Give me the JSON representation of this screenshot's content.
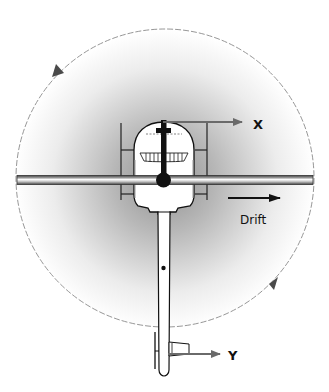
{
  "diagram": {
    "labels": {
      "x_axis": "X",
      "y_axis": "Y",
      "drift": "Drift"
    },
    "elements": {
      "rotor_disk": "dashed circle with two rotation-direction arrowheads (counter-clockwise indication)",
      "main_rotor_blade": "horizontal blade across the disk",
      "fuselage": "cockpit cabin viewed from above",
      "tail_boom": "long narrow tail boom with tail rotor",
      "rotor_hub": "black circle at center"
    },
    "colors": {
      "disk_gradient_center": "#9a9a9a",
      "disk_gradient_edge": "#ffffff",
      "outline": "#111111",
      "arrow": "#6a6a6a",
      "dashed_circle": "#888888"
    }
  }
}
